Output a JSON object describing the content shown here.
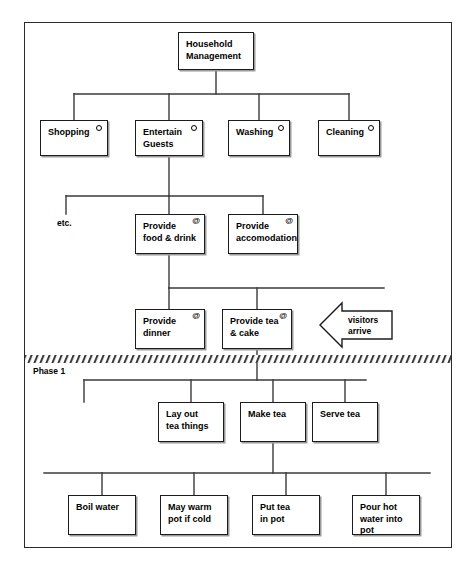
{
  "figure": {
    "phase_label": "Phase 1",
    "etc_label": "etc.",
    "arrow_label": "visitors\narrive",
    "caption": ""
  },
  "markers": {
    "circle": "o",
    "at": "@"
  },
  "colors": {
    "box_border": "#1c1c1c",
    "box_fill": "#ffffff",
    "line": "#3a3a3a",
    "frame": "#2b2b2b",
    "text": "#000000"
  },
  "chart_data": {
    "type": "diagram",
    "levels": 6,
    "nodes": [
      {
        "id": "household-management",
        "label": "Household\nManagement",
        "level": 0,
        "marker": "",
        "x": 178,
        "y": 32,
        "w": 76,
        "h": 38
      },
      {
        "id": "shopping",
        "label": "Shopping",
        "level": 1,
        "marker": "o",
        "x": 40,
        "y": 120,
        "w": 68,
        "h": 36
      },
      {
        "id": "entertain-guests",
        "label": "Entertain\nGuests",
        "level": 1,
        "marker": "o",
        "x": 135,
        "y": 120,
        "w": 68,
        "h": 36
      },
      {
        "id": "washing",
        "label": "Washing",
        "level": 1,
        "marker": "o",
        "x": 228,
        "y": 120,
        "w": 62,
        "h": 36
      },
      {
        "id": "cleaning",
        "label": "Cleaning",
        "level": 1,
        "marker": "o",
        "x": 318,
        "y": 120,
        "w": 62,
        "h": 36
      },
      {
        "id": "provide-food-drink",
        "label": "Provide\nfood & drink",
        "level": 2,
        "marker": "@",
        "x": 135,
        "y": 214,
        "w": 70,
        "h": 40
      },
      {
        "id": "provide-accomodation",
        "label": "Provide\naccomodation",
        "level": 2,
        "marker": "@",
        "x": 228,
        "y": 214,
        "w": 70,
        "h": 40
      },
      {
        "id": "provide-dinner",
        "label": "Provide\ndinner",
        "level": 3,
        "marker": "@",
        "x": 135,
        "y": 309,
        "w": 70,
        "h": 40
      },
      {
        "id": "provide-tea-cake",
        "label": "Provide tea\n& cake",
        "level": 3,
        "marker": "@",
        "x": 222,
        "y": 309,
        "w": 70,
        "h": 40
      },
      {
        "id": "lay-out-tea-things",
        "label": "Lay out\ntea things",
        "level": 4,
        "marker": "",
        "x": 158,
        "y": 402,
        "w": 66,
        "h": 40
      },
      {
        "id": "make-tea",
        "label": "Make tea",
        "level": 4,
        "marker": "",
        "x": 240,
        "y": 402,
        "w": 66,
        "h": 40
      },
      {
        "id": "serve-tea",
        "label": "Serve tea",
        "level": 4,
        "marker": "",
        "x": 312,
        "y": 402,
        "w": 66,
        "h": 40
      },
      {
        "id": "boil-water",
        "label": "Boil water",
        "level": 5,
        "marker": "",
        "x": 68,
        "y": 495,
        "w": 68,
        "h": 40
      },
      {
        "id": "may-warm-pot-if-cold",
        "label": "May warm\npot if cold",
        "level": 5,
        "marker": "",
        "x": 160,
        "y": 495,
        "w": 68,
        "h": 40
      },
      {
        "id": "put-tea-in-pot",
        "label": "Put tea\nin pot",
        "level": 5,
        "marker": "",
        "x": 252,
        "y": 495,
        "w": 68,
        "h": 40
      },
      {
        "id": "pour-hot-water-into-pot",
        "label": "Pour hot\nwater into\npot",
        "level": 5,
        "marker": "",
        "x": 352,
        "y": 495,
        "w": 68,
        "h": 40
      }
    ],
    "edges": [
      {
        "from": "household-management",
        "to": "shopping"
      },
      {
        "from": "household-management",
        "to": "entertain-guests"
      },
      {
        "from": "household-management",
        "to": "washing"
      },
      {
        "from": "household-management",
        "to": "cleaning"
      },
      {
        "from": "entertain-guests",
        "to": "etc"
      },
      {
        "from": "entertain-guests",
        "to": "provide-food-drink"
      },
      {
        "from": "entertain-guests",
        "to": "provide-accomodation"
      },
      {
        "from": "provide-food-drink",
        "to": "provide-dinner"
      },
      {
        "from": "provide-food-drink",
        "to": "provide-tea-cake"
      },
      {
        "from": "provide-tea-cake",
        "to": "lay-out-tea-things"
      },
      {
        "from": "provide-tea-cake",
        "to": "make-tea"
      },
      {
        "from": "provide-tea-cake",
        "to": "serve-tea"
      },
      {
        "from": "make-tea",
        "to": "boil-water"
      },
      {
        "from": "make-tea",
        "to": "may-warm-pot-if-cold"
      },
      {
        "from": "make-tea",
        "to": "put-tea-in-pot"
      },
      {
        "from": "make-tea",
        "to": "pour-hot-water-into-pot"
      }
    ],
    "annotations": [
      {
        "id": "phase-1",
        "text": "Phase 1",
        "kind": "phase-divider-label"
      },
      {
        "id": "etc",
        "text": "etc.",
        "kind": "branch-stub-label"
      },
      {
        "id": "visitors-arrive",
        "text": "visitors arrive",
        "kind": "event-arrow",
        "direction": "left"
      }
    ]
  }
}
